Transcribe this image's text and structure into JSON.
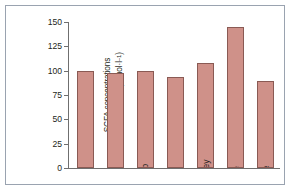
{
  "figure": {
    "background_color": "#ffffff",
    "frame_color": "#9aa3b0"
  },
  "chart_data": {
    "type": "bar",
    "title": "",
    "xlabel": "",
    "ylabel": "SCFA concentrations in caecal fluid (mmol·l⁻¹)",
    "ylabel_line1": "SCFA concentrations",
    "ylabel_line2_prefix": "in caecal fluid (mmol·l",
    "ylabel_line2_sup": "–1",
    "ylabel_line2_suffix": ")",
    "categories": [
      "Dog",
      "Goat",
      "Sheep",
      "Pig",
      "Donkey",
      "Cattle",
      "Horse"
    ],
    "values": [
      100,
      98,
      100,
      94,
      108,
      145,
      89
    ],
    "ylim": [
      0,
      150
    ],
    "yticks": [
      0,
      25,
      50,
      75,
      100,
      125,
      150
    ],
    "ytick_labels": [
      "0",
      "25",
      "50",
      "75",
      "100",
      "125",
      "150"
    ],
    "grid": false,
    "legend": false,
    "bar_fill_color": "#cf9189",
    "bar_edge_color": "#8a5a54",
    "axis_color": "#6f6f6f"
  }
}
